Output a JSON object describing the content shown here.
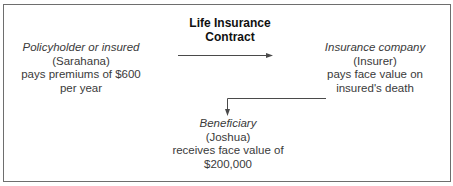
{
  "diagram": {
    "title_line1": "Life Insurance",
    "title_line2": "Contract",
    "policyholder": {
      "role": "Policyholder or insured",
      "name": "(Sarahana)",
      "action_line1": "pays premiums of $600",
      "action_line2": "per year"
    },
    "insurer": {
      "role": "Insurance company",
      "name": "(Insurer)",
      "action_line1": "pays face value on",
      "action_line2": "insured's death"
    },
    "beneficiary": {
      "role": "Beneficiary",
      "name": "(Joshua)",
      "action_line1": "receives face value of",
      "action_line2": "$200,000"
    },
    "edges": [
      {
        "from": "policyholder",
        "to": "insurer",
        "type": "arrow"
      },
      {
        "from": "insurer",
        "to": "beneficiary",
        "type": "elbow-arrow"
      }
    ],
    "colors": {
      "border": "#6e6e6e",
      "text": "#3a3a3a",
      "title": "#111111",
      "line": "#4a4a4a"
    }
  }
}
